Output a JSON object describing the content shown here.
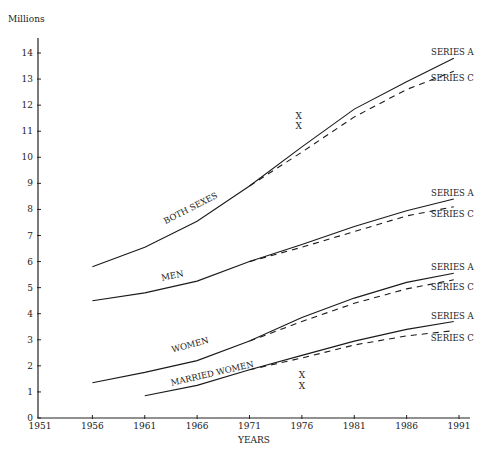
{
  "chart_data": {
    "type": "line",
    "title": "",
    "ylabel": "Millions",
    "xlabel": "YEARS",
    "xlim": [
      1951,
      1991
    ],
    "ylim": [
      0,
      14
    ],
    "x_ticks": [
      "1951",
      "1956",
      "1961",
      "1966",
      "1971",
      "1976",
      "1981",
      "1986",
      "1991"
    ],
    "y_ticks": [
      "0",
      "1",
      "2",
      "3",
      "4",
      "5",
      "6",
      "7",
      "8",
      "9",
      "10",
      "11",
      "12",
      "13",
      "14"
    ],
    "grid": false,
    "groups": [
      {
        "name": "BOTH SEXES",
        "series": [
          {
            "name": "SERIES A",
            "style": "solid",
            "x": [
              1956,
              1961,
              1966,
              1971,
              1976,
              1981,
              1986,
              1990.5
            ],
            "y": [
              5.8,
              6.55,
              7.55,
              8.9,
              10.4,
              11.85,
              12.9,
              13.8
            ]
          },
          {
            "name": "SERIES C",
            "style": "dashed",
            "x": [
              1971,
              1976,
              1981,
              1986,
              1990.5
            ],
            "y": [
              8.9,
              10.2,
              11.55,
              12.6,
              13.3
            ]
          }
        ]
      },
      {
        "name": "MEN",
        "series": [
          {
            "name": "SERIES A",
            "style": "solid",
            "x": [
              1956,
              1961,
              1966,
              1971,
              1976,
              1981,
              1986,
              1990.5
            ],
            "y": [
              4.5,
              4.8,
              5.25,
              6.0,
              6.65,
              7.35,
              7.95,
              8.4
            ]
          },
          {
            "name": "SERIES C",
            "style": "dashed",
            "x": [
              1971,
              1976,
              1981,
              1986,
              1990.5
            ],
            "y": [
              6.0,
              6.55,
              7.15,
              7.75,
              8.1
            ]
          }
        ]
      },
      {
        "name": "WOMEN",
        "series": [
          {
            "name": "SERIES A",
            "style": "solid",
            "x": [
              1956,
              1961,
              1966,
              1971,
              1976,
              1981,
              1986,
              1990.5
            ],
            "y": [
              1.35,
              1.75,
              2.2,
              2.95,
              3.85,
              4.6,
              5.2,
              5.55
            ]
          },
          {
            "name": "SERIES C",
            "style": "dashed",
            "x": [
              1971,
              1976,
              1981,
              1986,
              1990.5
            ],
            "y": [
              2.95,
              3.7,
              4.4,
              4.95,
              5.3
            ]
          }
        ]
      },
      {
        "name": "MARRIED WOMEN",
        "series": [
          {
            "name": "SERIES A",
            "style": "solid",
            "x": [
              1961,
              1966,
              1971,
              1976,
              1981,
              1986,
              1990.5
            ],
            "y": [
              0.85,
              1.25,
              1.85,
              2.4,
              2.95,
              3.4,
              3.7
            ]
          },
          {
            "name": "SERIES C",
            "style": "dashed",
            "x": [
              1971,
              1976,
              1981,
              1986,
              1990.5
            ],
            "y": [
              1.85,
              2.3,
              2.8,
              3.15,
              3.35
            ]
          }
        ]
      }
    ],
    "annotations": [
      {
        "text": "X",
        "x": 1975.7,
        "y": 11.6
      },
      {
        "text": "X",
        "x": 1975.7,
        "y": 11.2
      },
      {
        "text": "X",
        "x": 1976,
        "y": 1.65
      },
      {
        "text": "X",
        "x": 1976,
        "y": 1.23
      }
    ]
  }
}
